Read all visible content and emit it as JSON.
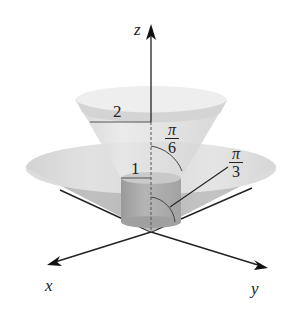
{
  "figure": {
    "axes": {
      "z_label": "z",
      "x_label": "x",
      "y_label": "y"
    },
    "labels": {
      "radius_upper": "2",
      "radius_cylinder": "1",
      "angle_small": {
        "numerator": "π",
        "denominator": "6"
      },
      "angle_large": {
        "numerator": "π",
        "denominator": "3"
      }
    },
    "colors": {
      "background": "#ffffff",
      "axis": "#222222",
      "surface_light": "#e2e2e2",
      "surface_mid": "#c8c8c8",
      "surface_dark": "#9a9a9a"
    }
  }
}
